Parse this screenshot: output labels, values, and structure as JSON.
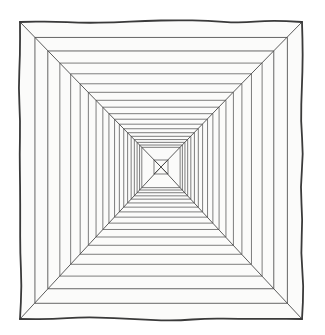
{
  "figure": {
    "title": "Nested squares one-point perspective drawing",
    "description": "Hand-drawn square tunnel: a series of concentric squares joined by four corner diagonals converging on a central vanishing point, with an X in the innermost square.",
    "medium": "ink line drawing on white paper",
    "background_color": "#ffffff",
    "paper_tint": "#fbfbfa",
    "line_color": "#4a4a4a",
    "inner_line_color": "#5d5d5d",
    "outer_border_color": "#3a3a3a",
    "outer_border_width": 1.8,
    "inner_line_width": 0.8,
    "diagonal_line_width": 0.9
  },
  "geometry": {
    "canvas_width": 325,
    "canvas_height": 335,
    "outer_left": 20,
    "outer_top": 22,
    "outer_right": 302,
    "outer_bottom": 319,
    "vanishing_point_x": 161,
    "vanishing_point_y": 167,
    "square_count": 19,
    "step_ratio": 0.895,
    "innermost_half_width": 7,
    "innermost_half_height": 7,
    "center_x_marks": true,
    "wobble_amplitude": 2.2
  },
  "labels": {
    "vanishing_point": "vanishing point",
    "outer_frame": "outer frame",
    "diagonal_top_left": "diagonal from top-left corner",
    "diagonal_top_right": "diagonal from top-right corner",
    "diagonal_bottom_left": "diagonal from bottom-left corner",
    "diagonal_bottom_right": "diagonal from bottom-right corner",
    "center_cross": "central X cross",
    "nested_square": "nested square"
  }
}
